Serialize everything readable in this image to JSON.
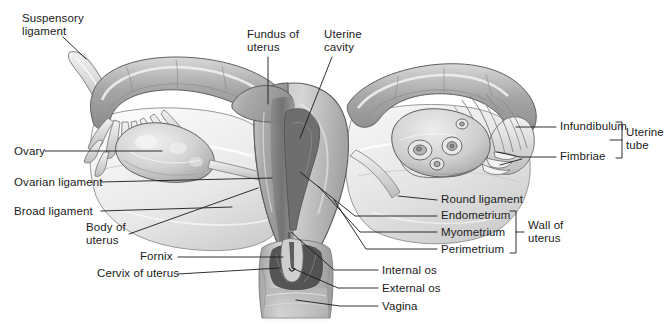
{
  "figure": {
    "background_color": "#ffffff",
    "text_color": "#1b1b1b",
    "leader_color": "#1a1a1a"
  },
  "labels": {
    "suspensory_ligament": "Suspensory\nligament",
    "ovary": "Ovary",
    "ovarian_ligament": "Ovarian ligament",
    "broad_ligament": "Broad ligament",
    "body_of_uterus": "Body of\nuterus",
    "fornix": "Fornix",
    "cervix_of_uterus": "Cervix of uterus",
    "fundus_of_uterus": "Fundus of\nuterus",
    "uterine_cavity": "Uterine\ncavity",
    "infundibulum": "Infundibulum",
    "fimbriae": "Fimbriae",
    "uterine_tube": "Uterine\ntube",
    "round_ligament": "Round ligament",
    "endometrium": "Endometrium",
    "myometrium": "Myometrium",
    "perimetrium": "Perimetrium",
    "wall_of_uterus": "Wall of\nuterus",
    "internal_os": "Internal os",
    "external_os": "External os",
    "vagina": "Vagina"
  },
  "groups": [
    {
      "name": "uterine-tube",
      "bracket_label": "Uterine\ntube",
      "members": [
        "Infundibulum",
        "Fimbriae"
      ]
    },
    {
      "name": "wall-of-uterus",
      "bracket_label": "Wall of\nuterus",
      "members": [
        "Endometrium",
        "Myometrium",
        "Perimetrium"
      ]
    }
  ],
  "credit": "",
  "palette": {
    "outline": "#4a4a4a",
    "tube_wall": "#9a9a9a",
    "tube_wall_light": "#c9c9c9",
    "broad_ligament": "#e2e2e2",
    "broad_ligament_shade": "#cfcfcf",
    "ovary": "#cdcdcd",
    "ovary_light": "#e6e6e6",
    "myometrium": "#b4b4b4",
    "endometrium": "#8d8d8d",
    "cavity": "#6f6f6f",
    "vagina": "#bdbdbd",
    "vagina_dark": "#8a8a8a",
    "highlight": "#f2f2f2"
  }
}
